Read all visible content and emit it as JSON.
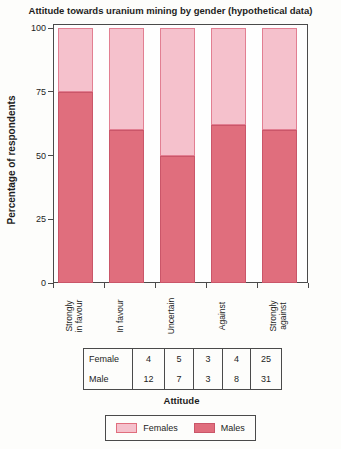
{
  "title": "Attitude towards uranium mining by gender (hypothetical data)",
  "chart_data": {
    "type": "bar",
    "subtype": "stacked-percentage",
    "title": "Attitude towards uranium mining by gender (hypothetical data)",
    "xlabel": "Attitude",
    "ylabel": "Percentage of respondents",
    "ylim": [
      0,
      100
    ],
    "yticks": [
      0,
      25,
      50,
      75,
      100
    ],
    "grid": "off",
    "legend_position": "bottom",
    "categories": [
      "Strongly\nin favour",
      "In favour",
      "Uncertain",
      "Against",
      "Strongly\nagainst"
    ],
    "series": [
      {
        "name": "Males",
        "percent_values": [
          75,
          60,
          50,
          62,
          60
        ]
      },
      {
        "name": "Females",
        "percent_values": [
          25,
          40,
          50,
          38,
          40
        ]
      }
    ],
    "counts_table": {
      "rows": [
        {
          "label": "Female",
          "values": [
            "4",
            "5",
            "3",
            "4",
            "25"
          ]
        },
        {
          "label": "Male",
          "values": [
            "12",
            "7",
            "3",
            "8",
            "31"
          ]
        }
      ]
    }
  },
  "axis": {
    "ytick_labels": [
      "0",
      "25",
      "50",
      "75",
      "100"
    ],
    "xlabel": "Attitude",
    "ylabel": "Percentage of respondents"
  },
  "legend": {
    "females_label": "Females",
    "males_label": "Males"
  },
  "colors": {
    "females_fill": "#f5c1cc",
    "females_border": "#e27f92",
    "males_fill": "#e06e7d",
    "males_border": "#ca5669",
    "frame": "#4a4a4a",
    "text": "#1d1d1d"
  }
}
